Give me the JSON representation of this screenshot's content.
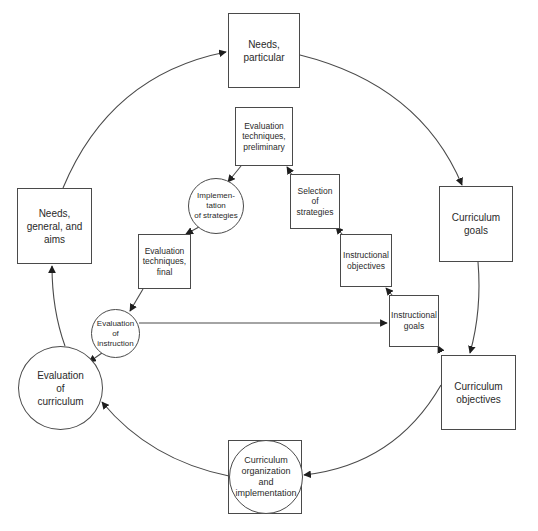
{
  "diagram": {
    "type": "cyclical curriculum and instruction model",
    "outer_cycle": [
      {
        "id": "needs_particular",
        "label": "Needs,\nparticular",
        "shape": "square"
      },
      {
        "id": "curriculum_goals",
        "label": "Curriculum\ngoals",
        "shape": "square"
      },
      {
        "id": "curriculum_objectives",
        "label": "Curriculum\nobjectives",
        "shape": "square"
      },
      {
        "id": "curriculum_organization",
        "label": "Curriculum\norganization\nand\nimplementation",
        "shape": "circle-in-square"
      },
      {
        "id": "evaluation_curriculum",
        "label": "Evaluation\nof\ncurriculum",
        "shape": "circle"
      },
      {
        "id": "needs_general",
        "label": "Needs,\ngeneral, and\naims",
        "shape": "square"
      }
    ],
    "inner_cycle": [
      {
        "id": "instructional_goals",
        "label": "Instructional\ngoals",
        "shape": "square"
      },
      {
        "id": "instructional_objectives",
        "label": "Instructional\nobjectives",
        "shape": "square"
      },
      {
        "id": "selection_strategies",
        "label": "Selection\nof\nstrategies",
        "shape": "square"
      },
      {
        "id": "eval_tech_preliminary",
        "label": "Evaluation\ntechniques,\npreliminary",
        "shape": "square"
      },
      {
        "id": "implementation_strategies",
        "label": "Implemen-\ntation\nof strategies",
        "shape": "circle"
      },
      {
        "id": "eval_tech_final",
        "label": "Evaluation\ntechniques,\nfinal",
        "shape": "square"
      },
      {
        "id": "evaluation_instruction",
        "label": "Evaluation\nof\ninstruction",
        "shape": "circle"
      }
    ],
    "edges": [
      [
        "needs_general",
        "needs_particular"
      ],
      [
        "needs_particular",
        "curriculum_goals"
      ],
      [
        "curriculum_goals",
        "curriculum_objectives"
      ],
      [
        "curriculum_objectives",
        "curriculum_organization"
      ],
      [
        "curriculum_organization",
        "evaluation_curriculum"
      ],
      [
        "evaluation_curriculum",
        "needs_general"
      ],
      [
        "curriculum_objectives",
        "instructional_goals"
      ],
      [
        "instructional_goals",
        "instructional_objectives"
      ],
      [
        "instructional_objectives",
        "selection_strategies"
      ],
      [
        "selection_strategies",
        "eval_tech_preliminary"
      ],
      [
        "eval_tech_preliminary",
        "implementation_strategies"
      ],
      [
        "implementation_strategies",
        "eval_tech_final"
      ],
      [
        "eval_tech_final",
        "evaluation_instruction"
      ],
      [
        "evaluation_instruction",
        "evaluation_curriculum"
      ],
      [
        "evaluation_instruction",
        "instructional_goals"
      ]
    ]
  },
  "colors": {
    "line": "#4a4a4a",
    "text": "#2a2a2a",
    "background": "#ffffff"
  }
}
